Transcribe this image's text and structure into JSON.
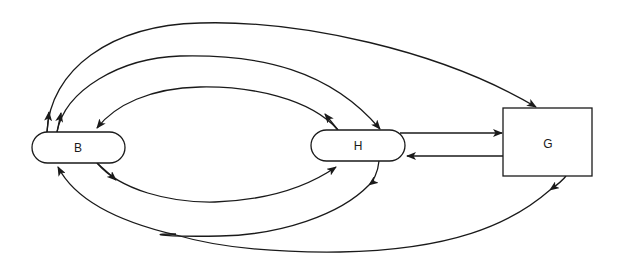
{
  "diagram": {
    "type": "flow-diagram",
    "nodes": [
      {
        "id": "B",
        "label": "B",
        "shape": "rounded-pill"
      },
      {
        "id": "H",
        "label": "H",
        "shape": "rounded-pill"
      },
      {
        "id": "G",
        "label": "G",
        "shape": "rectangle"
      }
    ],
    "edges": [
      {
        "from": "B",
        "to": "G",
        "route": "outer top arc"
      },
      {
        "from": "B",
        "to": "H",
        "route": "middle top arc"
      },
      {
        "from": "H",
        "to": "B",
        "route": "inner top arc"
      },
      {
        "from": "B",
        "to": "H",
        "route": "inner bottom arc"
      },
      {
        "from": "H",
        "to": "B",
        "route": "outer bottom arc (merges)"
      },
      {
        "from": "G",
        "to": "B",
        "route": "lowest bottom arc (merges)"
      },
      {
        "from": "H",
        "to": "G",
        "route": "straight top"
      },
      {
        "from": "G",
        "to": "H",
        "route": "straight bottom"
      }
    ],
    "stroke_color": "#1a1a1a",
    "background": "#ffffff"
  }
}
